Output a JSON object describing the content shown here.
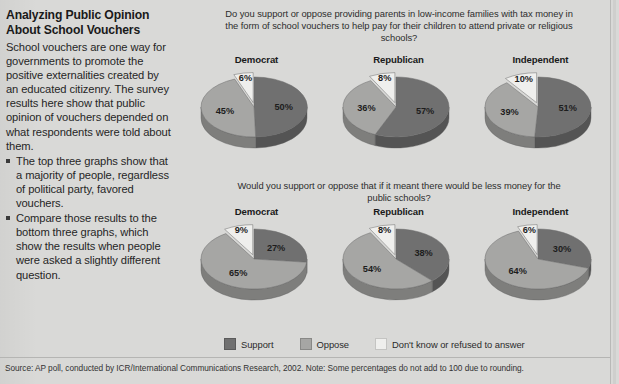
{
  "headline": "Analyzing Public Opinion About School Vouchers",
  "intro": "School vouchers are one way for governments to promote the positive externalities created by an educated citizenry. The survey results here show that public opinion of vouchers depended on what respondents were told about them.",
  "bullets": [
    "The top three graphs show that a majority of people, regardless of political party, favored vouchers.",
    "Compare those results to the bottom three graphs, which show the results when people were asked a slightly different question."
  ],
  "questions": {
    "top": "Do you support or oppose providing parents in low-income families with tax money in the form of school vouchers to help pay for their children to attend private or religious schools?",
    "bottom": "Would you support or oppose that if it meant there would be less money for the public schools?"
  },
  "legend": [
    {
      "label": "Support",
      "color": "#707070"
    },
    {
      "label": "Oppose",
      "color": "#a6a6a4"
    },
    {
      "label": "Don't know or refused to answer",
      "color": "#efefed"
    }
  ],
  "source": "Source: AP poll, conducted by ICR/International Communications Research, 2002.  Note: Some percentages do not add to 100 due to rounding.",
  "colors": {
    "background": "#d9d9d7",
    "support": "#707070",
    "oppose": "#a6a6a4",
    "dontknow": "#efefed",
    "support_side": "#545454",
    "oppose_side": "#7e7e7c",
    "dontknow_side": "#c2c2c0",
    "text": "#262626"
  },
  "chart_data": [
    {
      "type": "pie",
      "title": "Democrat",
      "group": "top",
      "question": "Do you support or oppose providing parents in low-income families with tax money in the form of school vouchers to help pay for their children to attend private or religious schools?",
      "labels": [
        "Support",
        "Oppose",
        "Don't know or refused to answer"
      ],
      "values": [
        50,
        45,
        6
      ],
      "value_labels": [
        "50%",
        "45%",
        "6%"
      ]
    },
    {
      "type": "pie",
      "title": "Republican",
      "group": "top",
      "question": "Do you support or oppose providing parents in low-income families with tax money in the form of school vouchers to help pay for their children to attend private or religious schools?",
      "labels": [
        "Support",
        "Oppose",
        "Don't know or refused to answer"
      ],
      "values": [
        57,
        36,
        8
      ],
      "value_labels": [
        "57%",
        "36%",
        "8%"
      ]
    },
    {
      "type": "pie",
      "title": "Independent",
      "group": "top",
      "question": "Do you support or oppose providing parents in low-income families with tax money in the form of school vouchers to help pay for their children to attend private or religious schools?",
      "labels": [
        "Support",
        "Oppose",
        "Don't know or refused to answer"
      ],
      "values": [
        51,
        39,
        10
      ],
      "value_labels": [
        "51%",
        "39%",
        "10%"
      ]
    },
    {
      "type": "pie",
      "title": "Democrat",
      "group": "bottom",
      "question": "Would you support or oppose that if it meant there would be less money for the public schools?",
      "labels": [
        "Support",
        "Oppose",
        "Don't know or refused to answer"
      ],
      "values": [
        27,
        65,
        9
      ],
      "value_labels": [
        "27%",
        "65%",
        "9%"
      ]
    },
    {
      "type": "pie",
      "title": "Republican",
      "group": "bottom",
      "question": "Would you support or oppose that if it meant there would be less money for the public schools?",
      "labels": [
        "Support",
        "Oppose",
        "Don't know or refused to answer"
      ],
      "values": [
        38,
        54,
        8
      ],
      "value_labels": [
        "38%",
        "54%",
        "8%"
      ]
    },
    {
      "type": "pie",
      "title": "Independent",
      "group": "bottom",
      "question": "Would you support or oppose that if it meant there would be less money for the public schools?",
      "labels": [
        "Support",
        "Oppose",
        "Don't know or refused to answer"
      ],
      "values": [
        30,
        64,
        6
      ],
      "value_labels": [
        "30%",
        "64%",
        "6%"
      ]
    }
  ]
}
